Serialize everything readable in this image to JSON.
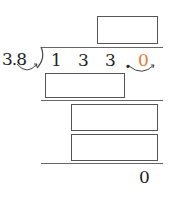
{
  "problem": {
    "divisor": "3.8",
    "dividend_digits": [
      "1",
      "3",
      "3",
      "."
    ],
    "dividend_appended_zero": "0",
    "remainder": "0",
    "answer_boxes": [
      {
        "id": "quotient",
        "value": ""
      },
      {
        "id": "product-1",
        "value": ""
      },
      {
        "id": "difference-1",
        "value": ""
      },
      {
        "id": "product-2",
        "value": ""
      }
    ],
    "colors": {
      "moved_decimal_zero": "#e87a2b",
      "ink": "#222222"
    }
  }
}
